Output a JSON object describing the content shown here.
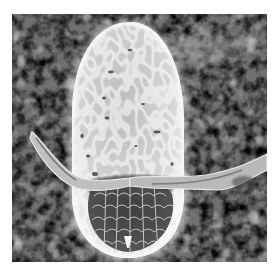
{
  "image": {
    "subject": "scanning electron micrograph of an insect egg with lateral floats",
    "palette": {
      "background": "#ffffff",
      "substrate_dark": "#3a3a3a",
      "substrate_mid": "#6b6b6b",
      "substrate_light": "#c8c8c8",
      "egg_light": "#e6e6e6",
      "egg_mid": "#bdbdbd",
      "egg_dark": "#4a4a4a"
    }
  }
}
